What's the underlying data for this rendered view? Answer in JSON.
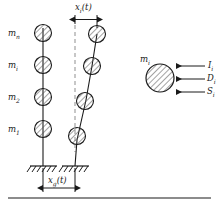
{
  "figure": {
    "type": "structural-dynamics-diagram",
    "line_color": "#1a1a1a",
    "hatch_color": "#555555",
    "dashed_color": "#999999"
  },
  "undeformed_column": {
    "masses": [
      {
        "label": "m",
        "sub": "n"
      },
      {
        "label": "m",
        "sub": "i"
      },
      {
        "label": "m",
        "sub": "2"
      },
      {
        "label": "m",
        "sub": "1"
      }
    ]
  },
  "deformed_column": {
    "displacement_label": {
      "base": "x",
      "sub": "i",
      "arg": "(t)"
    },
    "reference_line": "dashed-vertical"
  },
  "ground": {
    "displacement_label": {
      "base": "x",
      "sub": "g",
      "arg": "(t)"
    },
    "support_count": 2,
    "support_type": "fixed-hatched"
  },
  "free_body": {
    "mass_label": {
      "base": "m",
      "sub": "i"
    },
    "forces": [
      {
        "base": "I",
        "sub": "i",
        "name": "inertia-force",
        "direction": "left"
      },
      {
        "base": "D",
        "sub": "i",
        "name": "damping-force",
        "direction": "left"
      },
      {
        "base": "S",
        "sub": "i",
        "name": "stiffness-force",
        "direction": "left"
      }
    ]
  }
}
